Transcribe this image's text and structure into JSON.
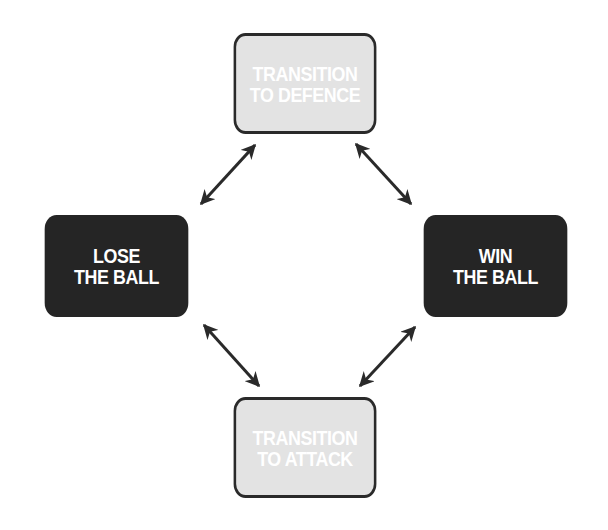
{
  "diagram": {
    "type": "cycle",
    "nodes": [
      {
        "id": "top",
        "lines": [
          "TRANSITION",
          "TO DEFENCE"
        ],
        "style": "light"
      },
      {
        "id": "left",
        "lines": [
          "LOSE",
          "THE BALL"
        ],
        "style": "dark"
      },
      {
        "id": "right",
        "lines": [
          "WIN",
          "THE BALL"
        ],
        "style": "dark"
      },
      {
        "id": "bottom",
        "lines": [
          "TRANSITION",
          "TO ATTACK"
        ],
        "style": "light"
      }
    ],
    "edges": [
      {
        "from": "top",
        "to": "left",
        "bidirectional": true
      },
      {
        "from": "top",
        "to": "right",
        "bidirectional": true
      },
      {
        "from": "bottom",
        "to": "left",
        "bidirectional": true
      },
      {
        "from": "bottom",
        "to": "right",
        "bidirectional": true
      }
    ],
    "colors": {
      "light_fill": "#e3e3e3",
      "dark_fill": "#252525",
      "border": "#2a2a2a",
      "text": "#ffffff",
      "arrow": "#2a2a2a"
    }
  }
}
